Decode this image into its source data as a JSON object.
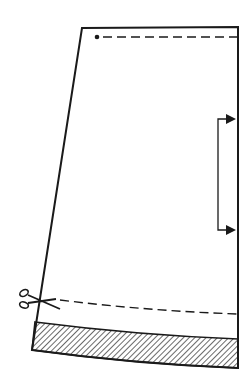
{
  "diagram": {
    "type": "sewing-pattern",
    "colors": {
      "line": "#1a1a1a",
      "background": "#ffffff",
      "hatch": "#1a1a1a"
    },
    "pattern_piece": {
      "outline": {
        "top_left": [
          82,
          28
        ],
        "top_right": [
          238,
          27
        ],
        "bottom_right": [
          238,
          368
        ],
        "bottom_left": [
          32,
          350
        ]
      },
      "waist_seam_line": {
        "y": 37,
        "x_start": 103,
        "x_end": 238,
        "style": "dashed"
      },
      "waist_dot": {
        "x": 97,
        "y": 37
      },
      "grainline": {
        "x": 218,
        "y_top": 119,
        "y_bottom": 230,
        "arrow_target_x": 236
      },
      "cut_line": {
        "x_start": 60,
        "y_start": 300,
        "x_end": 238,
        "y_end": 314,
        "style": "dashed"
      },
      "hem_band": {
        "top_left": [
          35,
          322
        ],
        "top_right": [
          238,
          339
        ],
        "bottom_right": [
          238,
          368
        ],
        "bottom_left": [
          32,
          350
        ],
        "fill": "hatched"
      },
      "scissors_icon": {
        "x": 24,
        "y": 293
      }
    }
  }
}
